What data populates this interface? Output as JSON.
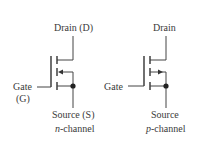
{
  "n_channel": {
    "drain_label": "Drain (D)",
    "gate_label": "Gate",
    "gate_abbrev": "(G)",
    "source_label": "Source (S)",
    "caption_italic": "n",
    "caption_rest": "-channel",
    "arrow_direction": "inward"
  },
  "p_channel": {
    "drain_label": "Drain",
    "gate_label": "Gate",
    "source_label": "Source",
    "caption_italic": "p",
    "caption_rest": "-channel",
    "arrow_direction": "outward"
  },
  "colors": {
    "line": "#444444",
    "text": "#3a3a3a",
    "background": "#ffffff"
  }
}
